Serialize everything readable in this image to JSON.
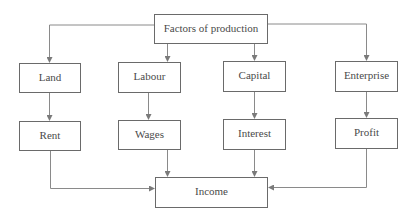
{
  "diagram": {
    "type": "flowchart",
    "colors": {
      "box_border": "#6a6a6a",
      "text": "#4a4a4a",
      "connector": "#8a8a8a",
      "background": "#ffffff"
    },
    "root": {
      "id": "factors",
      "label": "Factors of production"
    },
    "factors": [
      {
        "id": "land",
        "label": "Land"
      },
      {
        "id": "labour",
        "label": "Labour"
      },
      {
        "id": "capital",
        "label": "Capital"
      },
      {
        "id": "enterprise",
        "label": "Enterprise"
      }
    ],
    "rewards": [
      {
        "id": "rent",
        "label": "Rent"
      },
      {
        "id": "wages",
        "label": "Wages"
      },
      {
        "id": "interest",
        "label": "Interest"
      },
      {
        "id": "profit",
        "label": "Profit"
      }
    ],
    "sink": {
      "id": "income",
      "label": "Income"
    },
    "edges": [
      {
        "from": "factors",
        "to": "land"
      },
      {
        "from": "factors",
        "to": "labour"
      },
      {
        "from": "factors",
        "to": "capital"
      },
      {
        "from": "factors",
        "to": "enterprise"
      },
      {
        "from": "land",
        "to": "rent"
      },
      {
        "from": "labour",
        "to": "wages"
      },
      {
        "from": "capital",
        "to": "interest"
      },
      {
        "from": "enterprise",
        "to": "profit"
      },
      {
        "from": "rent",
        "to": "income"
      },
      {
        "from": "wages",
        "to": "income"
      },
      {
        "from": "interest",
        "to": "income"
      },
      {
        "from": "profit",
        "to": "income"
      }
    ]
  }
}
